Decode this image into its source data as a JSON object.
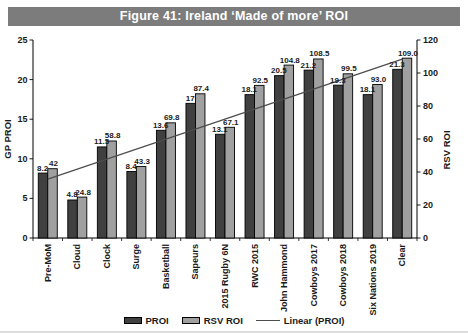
{
  "figure": {
    "title": "Figure 41: Ireland ‘Made of more’ ROI"
  },
  "chart_data": {
    "type": "bar",
    "title": "Figure 41: Ireland ‘Made of more’ ROI",
    "title_bar_color": "#7c7c7c",
    "categories": [
      "Pre-MoM",
      "Cloud",
      "Clock",
      "Surge",
      "Basketball",
      "Sapeurs",
      "2015 Rugby 6N",
      "RWC 2015",
      "John Hammond",
      "Cowboys 2017",
      "Cowboys 2018",
      "Six Nations 2019",
      "Clear"
    ],
    "series": [
      {
        "name": "PROI",
        "axis": "left",
        "color": "#404040",
        "border_color": "#000000",
        "values": [
          8.2,
          4.8,
          11.5,
          8.4,
          13.6,
          17,
          13.1,
          18.1,
          20.5,
          21.2,
          19.3,
          18.1,
          21.3
        ],
        "labels": [
          "8.2",
          "4.8",
          "11.5",
          "8.4",
          "13.6",
          "17",
          "13.1",
          "18.1",
          "20.5",
          "21.2",
          "19.3",
          "18.1",
          "21.3"
        ]
      },
      {
        "name": "RSV ROI",
        "axis": "right",
        "color": "#a0a0a0",
        "border_color": "#000000",
        "values": [
          42,
          24.8,
          58.8,
          43.3,
          69.8,
          87.4,
          67.1,
          92.5,
          104.8,
          108.5,
          99.5,
          93.0,
          109.0
        ],
        "labels": [
          "42",
          "24.8",
          "58.8",
          "43.3",
          "69.8",
          "87.4",
          "67.1",
          "92.5",
          "104.8",
          "108.5",
          "99.5",
          "93.0",
          "109.0"
        ]
      }
    ],
    "trendline": {
      "name": "Linear (PROI)",
      "basis": "PROI",
      "color": "#4d4d4d"
    },
    "axes": {
      "left": {
        "label": "GP PROI",
        "min": 0,
        "max": 25,
        "step": 5
      },
      "right": {
        "label": "RSV ROI",
        "min": 0,
        "max": 120,
        "step": 20
      }
    },
    "legend": {
      "position": "bottom",
      "entries": [
        "PROI",
        "RSV ROI",
        "Linear (PROI)"
      ]
    },
    "grid": false
  }
}
